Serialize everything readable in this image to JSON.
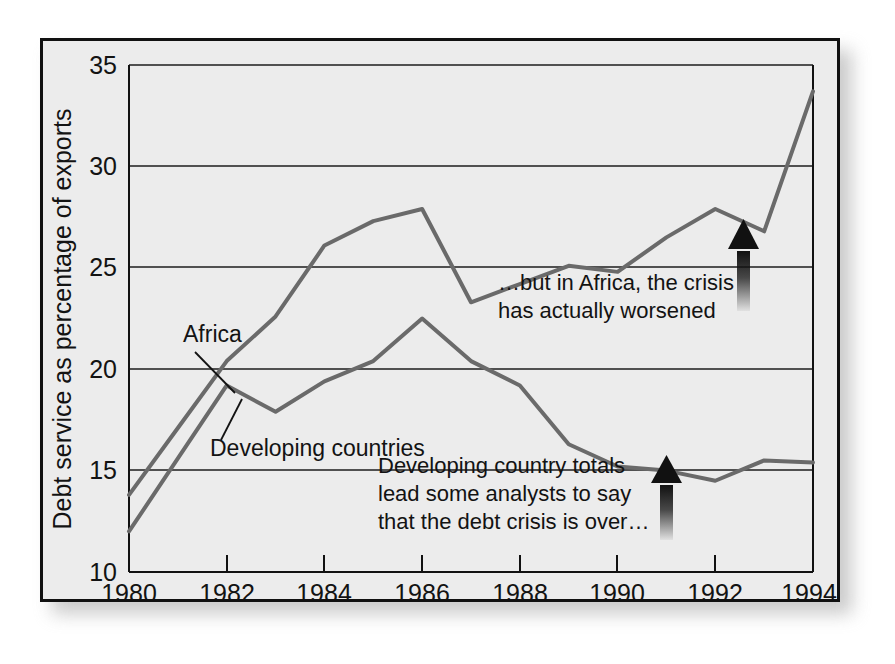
{
  "chart_data": {
    "type": "line",
    "title": "",
    "xlabel": "Year",
    "ylabel": "Debt service as percentage of exports",
    "xlim": [
      1980,
      1994
    ],
    "ylim": [
      10,
      35
    ],
    "ytick_labels": [
      "10",
      "15",
      "20",
      "25",
      "30",
      "35"
    ],
    "yticks": [
      10,
      15,
      20,
      25,
      30,
      35
    ],
    "xtick_labels": [
      "1980",
      "1982",
      "1984",
      "1986",
      "1988",
      "1990",
      "1992",
      "1994"
    ],
    "xticks": [
      1980,
      1982,
      1984,
      1986,
      1988,
      1990,
      1992,
      1994
    ],
    "grid": "horizontal",
    "legend": "inline-labels",
    "x": [
      1980,
      1981,
      1982,
      1983,
      1984,
      1985,
      1986,
      1987,
      1988,
      1989,
      1990,
      1991,
      1992,
      1993,
      1994
    ],
    "series": [
      {
        "name": "Africa",
        "color": "#6a6a6a",
        "values": [
          13.8,
          17.1,
          20.4,
          22.6,
          26.1,
          27.3,
          27.9,
          23.3,
          24.2,
          25.1,
          24.8,
          26.5,
          27.9,
          26.8,
          33.7
        ]
      },
      {
        "name": "Developing countries",
        "color": "#6a6a6a",
        "values": [
          12.0,
          15.6,
          19.2,
          17.9,
          19.4,
          20.4,
          22.5,
          20.4,
          19.2,
          16.3,
          15.2,
          15.0,
          14.5,
          15.5,
          15.4
        ]
      }
    ],
    "annotations": [
      {
        "id": "africa-annotation",
        "lines": [
          "…but in Africa, the crisis",
          "has actually worsened"
        ],
        "arrow_at_year": 1993,
        "arrow_points": "up"
      },
      {
        "id": "developing-annotation",
        "lines": [
          "Developing country totals",
          "lead some analysts to say",
          "that the debt crisis is over…"
        ],
        "arrow_at_year": 1991,
        "arrow_points": "up"
      }
    ],
    "series_callouts": [
      {
        "label": "Africa",
        "leader_line": true
      },
      {
        "label": "Developing countries",
        "leader_line": true
      }
    ]
  },
  "style": {
    "panel_background": "#ececec",
    "page_background": "#ffffff",
    "frame_color": "#111111",
    "line_color": "#6a6a6a",
    "grid_color": "#1d1d1d",
    "text_color": "#131313",
    "arrow_color": "#111111"
  }
}
